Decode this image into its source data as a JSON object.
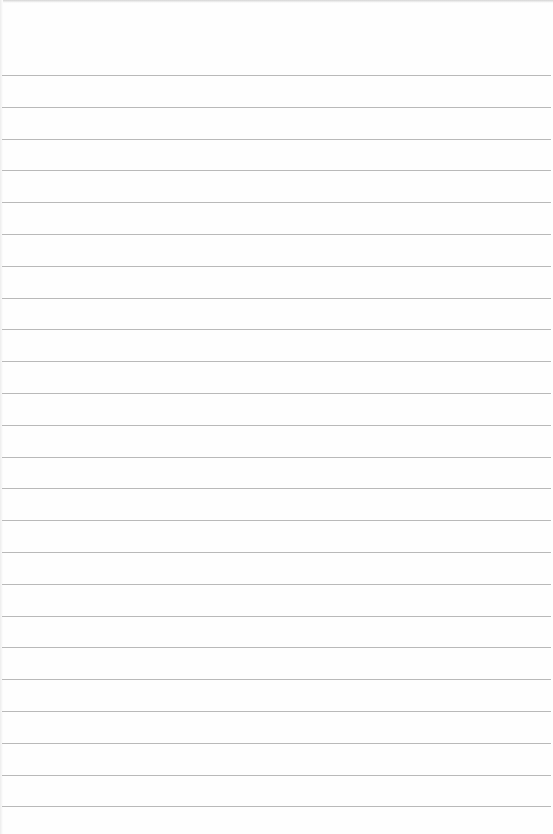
{
  "page": {
    "type": "lined-paper",
    "background_color": "#fefefe",
    "rule_color": "#b9b9b9",
    "rule_count": 24,
    "first_rule_y": 75,
    "rule_spacing": 31.8,
    "text_content": ""
  }
}
